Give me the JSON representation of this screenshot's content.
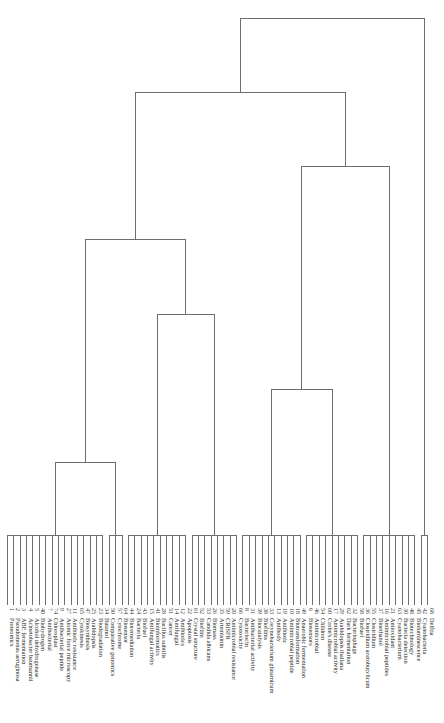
{
  "chart_data": {
    "type": "dendrogram",
    "title": "",
    "orientation": "vertical, root at top, leaves along bottom with rotated labels",
    "leaves": [
      {
        "id": 1,
        "label": "Proteomics"
      },
      {
        "id": 2,
        "label": "Pseudomonas aeruginosa"
      },
      {
        "id": 3,
        "label": "ABE fermentation"
      },
      {
        "id": 4,
        "label": "Acinetobacter baumannii"
      },
      {
        "id": 5,
        "label": "Alcohol dehydrogenase"
      },
      {
        "id": 40,
        "label": "Biohydrogen"
      },
      {
        "id": 7,
        "label": "Antibacterial"
      },
      {
        "id": 74,
        "label": "Chloroplast"
      },
      {
        "id": 9,
        "label": "Antibacterial peptide"
      },
      {
        "id": 27,
        "label": "Atomic force microscopy"
      },
      {
        "id": 11,
        "label": "Antibiotic resistance"
      },
      {
        "id": 65,
        "label": "Cytokinesis"
      },
      {
        "id": 47,
        "label": "Biosynthesis"
      },
      {
        "id": 25,
        "label": "Arabidopsis"
      },
      {
        "id": 23,
        "label": "Biodegradation"
      },
      {
        "id": 34,
        "label": "Butanol"
      },
      {
        "id": 50,
        "label": "Comparative genomics"
      },
      {
        "id": 57,
        "label": "Cytochrome"
      },
      {
        "id": 64,
        "label": "Biosensor"
      },
      {
        "id": 44,
        "label": "Bioremediation"
      },
      {
        "id": 24,
        "label": "Bacteria"
      },
      {
        "id": 43,
        "label": "Biofuel"
      },
      {
        "id": 15,
        "label": "Antifungal activity"
      },
      {
        "id": 41,
        "label": "Bioinformatics"
      },
      {
        "id": 28,
        "label": "Bacillus subtilis"
      },
      {
        "id": 51,
        "label": "Cancer"
      },
      {
        "id": 14,
        "label": "Antifungal"
      },
      {
        "id": 12,
        "label": "Antibiotics"
      },
      {
        "id": 22,
        "label": "Apoptosis"
      },
      {
        "id": 61,
        "label": "Crystal structure"
      },
      {
        "id": 52,
        "label": "Biofilm"
      },
      {
        "id": 53,
        "label": "Candida albicans"
      },
      {
        "id": 26,
        "label": "Biomass"
      },
      {
        "id": 35,
        "label": "Artemisinin"
      },
      {
        "id": 59,
        "label": "CRISPR"
      },
      {
        "id": 20,
        "label": "Antimicrobial resistance"
      },
      {
        "id": 66,
        "label": "Cytotoxicity"
      },
      {
        "id": 8,
        "label": "Bacteriocin"
      },
      {
        "id": 31,
        "label": "Antibacterial activity"
      },
      {
        "id": 39,
        "label": "Biocatalysis"
      },
      {
        "id": 38,
        "label": "Biofilms"
      },
      {
        "id": 33,
        "label": "Corynebacterium glutamicum"
      },
      {
        "id": 13,
        "label": "Antibody"
      },
      {
        "id": 19,
        "label": "Antibiotic"
      },
      {
        "id": 10,
        "label": "Antimicrobial peptide"
      },
      {
        "id": 18,
        "label": "Biotransformation"
      },
      {
        "id": 49,
        "label": "Anaerobic fermentation"
      },
      {
        "id": 6,
        "label": "Biosensors"
      },
      {
        "id": 46,
        "label": "Antimicrobial"
      },
      {
        "id": 54,
        "label": "Children"
      },
      {
        "id": 60,
        "label": "Crohn's disease"
      },
      {
        "id": 17,
        "label": "Antimicrobial activity"
      },
      {
        "id": 29,
        "label": "Arabidopsis thaliana"
      },
      {
        "id": 62,
        "label": "Dark fermentation"
      },
      {
        "id": 32,
        "label": "Bacteriophage"
      },
      {
        "id": 58,
        "label": "Biofuel"
      },
      {
        "id": 36,
        "label": "Clostridium acetobutylicum"
      },
      {
        "id": 55,
        "label": "Clostridium"
      },
      {
        "id": 37,
        "label": "Bioethanol"
      },
      {
        "id": 16,
        "label": "Antimicrobial peptides"
      },
      {
        "id": 21,
        "label": "Antioxidant"
      },
      {
        "id": 63,
        "label": "Cyanobacterium"
      },
      {
        "id": 30,
        "label": "Bacteria detection"
      },
      {
        "id": 48,
        "label": "Biotechnology"
      },
      {
        "id": 45,
        "label": "Bioluminescence"
      },
      {
        "id": 42,
        "label": "Cyanobacteria"
      },
      {
        "id": 68,
        "label": "Delftia"
      }
    ],
    "clusters": [
      {
        "name": "A1",
        "leaf_range": [
          0,
          15
        ],
        "merge_height_px": 535
      },
      {
        "name": "A2",
        "leaf_range": [
          16,
          18
        ],
        "merge_height_px": 535
      },
      {
        "name": "A",
        "children": [
          "A1",
          "A2"
        ],
        "merge_height_px": 462
      },
      {
        "name": "B1",
        "leaf_range": [
          19,
          28
        ],
        "merge_height_px": 535
      },
      {
        "name": "B2",
        "leaf_range": [
          29,
          36
        ],
        "merge_height_px": 535
      },
      {
        "name": "B",
        "children": [
          "B1",
          "B2"
        ],
        "merge_height_px": 314
      },
      {
        "name": "AB",
        "children": [
          "A",
          "B"
        ],
        "merge_height_px": 239
      },
      {
        "name": "C1",
        "leaf_range": [
          37,
          46
        ],
        "merge_height_px": 535
      },
      {
        "name": "C2",
        "leaf_range": [
          47,
          55
        ],
        "merge_height_px": 535
      },
      {
        "name": "C",
        "children": [
          "C1",
          "C2"
        ],
        "merge_height_px": 389
      },
      {
        "name": "D",
        "leaf_range": [
          56,
          64
        ],
        "merge_height_px": 535
      },
      {
        "name": "CD",
        "children": [
          "C",
          "D"
        ],
        "merge_height_px": 166
      },
      {
        "name": "ABCD",
        "children": [
          "AB",
          "CD"
        ],
        "merge_height_px": 92
      },
      {
        "name": "E",
        "leaf_range": [
          65,
          66
        ],
        "merge_height_px": 535
      },
      {
        "name": "root",
        "children": [
          "ABCD",
          "E"
        ],
        "merge_height_px": 18
      }
    ],
    "xlabel": "",
    "ylabel": "",
    "grid": false,
    "legend": null
  }
}
